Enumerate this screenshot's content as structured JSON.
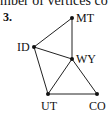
{
  "header": {
    "text": "mber of vertices connec"
  },
  "problem": {
    "number": "3."
  },
  "graph": {
    "vertices": [
      {
        "id": "MT",
        "label": "MT",
        "x": 72,
        "y": 18
      },
      {
        "id": "ID",
        "label": "ID",
        "x": 34,
        "y": 47
      },
      {
        "id": "WY",
        "label": "WY",
        "x": 72,
        "y": 59
      },
      {
        "id": "UT",
        "label": "UT",
        "x": 48,
        "y": 94
      },
      {
        "id": "CO",
        "label": "CO",
        "x": 97,
        "y": 94
      }
    ],
    "edges": [
      [
        "ID",
        "MT"
      ],
      [
        "MT",
        "WY"
      ],
      [
        "ID",
        "WY"
      ],
      [
        "ID",
        "UT"
      ],
      [
        "WY",
        "UT"
      ],
      [
        "WY",
        "CO"
      ],
      [
        "UT",
        "CO"
      ]
    ]
  }
}
